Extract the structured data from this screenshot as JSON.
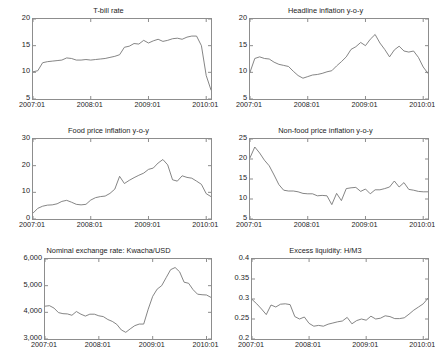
{
  "figure": {
    "width": 434,
    "height": 361,
    "background": "#ffffff",
    "line_color": "#6f6f6f",
    "axis_color": "#8d8d8d",
    "text_color": "#1c1c1c"
  },
  "chart_data": [
    {
      "id": "tbill",
      "type": "line",
      "title": "T-bill rate",
      "xlabel": "",
      "ylabel": "",
      "grid": false,
      "legend": null,
      "xlim": [
        2007.0,
        2010.083
      ],
      "ylim": [
        5,
        20
      ],
      "yticks": [
        5,
        10,
        15,
        20
      ],
      "ytick_labels": [
        "5",
        "10",
        "15",
        "20"
      ],
      "xticks": [
        2007.0,
        2008.0,
        2009.0,
        2010.0
      ],
      "xtick_labels": [
        "2007:01",
        "2008:01",
        "2009:01",
        "2010:01"
      ],
      "x": [
        2007.0,
        2007.083,
        2007.167,
        2007.25,
        2007.333,
        2007.417,
        2007.5,
        2007.583,
        2007.667,
        2007.75,
        2007.833,
        2007.917,
        2008.0,
        2008.083,
        2008.167,
        2008.25,
        2008.333,
        2008.417,
        2008.5,
        2008.583,
        2008.667,
        2008.75,
        2008.833,
        2008.917,
        2009.0,
        2009.083,
        2009.167,
        2009.25,
        2009.333,
        2009.417,
        2009.5,
        2009.583,
        2009.667,
        2009.75,
        2009.833,
        2009.917,
        2010.0,
        2010.083
      ],
      "values": [
        10.1,
        10.3,
        11.8,
        12.0,
        12.1,
        12.2,
        12.3,
        12.7,
        12.6,
        12.3,
        12.3,
        12.4,
        12.3,
        12.4,
        12.5,
        12.6,
        12.8,
        13.0,
        13.3,
        14.7,
        14.9,
        15.4,
        15.3,
        16.0,
        15.5,
        15.9,
        16.2,
        15.8,
        16.0,
        16.3,
        16.4,
        16.2,
        16.6,
        16.8,
        16.8,
        15.0,
        9.4,
        6.7
      ]
    },
    {
      "id": "headline",
      "type": "line",
      "title": "Headline inflation y-o-y",
      "xlabel": "",
      "ylabel": "",
      "grid": false,
      "legend": null,
      "xlim": [
        2007.0,
        2010.083
      ],
      "ylim": [
        5,
        20
      ],
      "yticks": [
        5,
        10,
        15,
        20
      ],
      "ytick_labels": [
        "5",
        "10",
        "15",
        "20"
      ],
      "xticks": [
        2007.0,
        2008.0,
        2009.0,
        2010.0
      ],
      "xtick_labels": [
        "2007:01",
        "2008:01",
        "2009:01",
        "2010:01"
      ],
      "x": [
        2007.0,
        2007.083,
        2007.167,
        2007.25,
        2007.333,
        2007.417,
        2007.5,
        2007.583,
        2007.667,
        2007.75,
        2007.833,
        2007.917,
        2008.0,
        2008.083,
        2008.167,
        2008.25,
        2008.333,
        2008.417,
        2008.5,
        2008.583,
        2008.667,
        2008.75,
        2008.833,
        2008.917,
        2009.0,
        2009.083,
        2009.167,
        2009.25,
        2009.333,
        2009.417,
        2009.5,
        2009.583,
        2009.667,
        2009.75,
        2009.833,
        2009.917,
        2010.0,
        2010.083
      ],
      "values": [
        10.0,
        12.6,
        12.9,
        12.6,
        12.5,
        11.9,
        11.5,
        11.3,
        11.1,
        10.2,
        9.4,
        8.9,
        9.2,
        9.5,
        9.6,
        9.8,
        10.1,
        10.3,
        11.2,
        12.0,
        12.9,
        14.3,
        14.8,
        15.6,
        15.0,
        16.2,
        17.1,
        15.5,
        14.3,
        12.9,
        14.2,
        14.9,
        14.0,
        13.8,
        14.0,
        12.8,
        11.0,
        9.8
      ]
    },
    {
      "id": "food",
      "type": "line",
      "title": "Food price inflation y-o-y",
      "xlabel": "",
      "ylabel": "",
      "grid": false,
      "legend": null,
      "xlim": [
        2007.0,
        2010.083
      ],
      "ylim": [
        0,
        30
      ],
      "yticks": [
        0,
        10,
        20,
        30
      ],
      "ytick_labels": [
        "0",
        "10",
        "20",
        "30"
      ],
      "xticks": [
        2007.0,
        2008.0,
        2009.0,
        2010.0
      ],
      "xtick_labels": [
        "2007:01",
        "2008:01",
        "2009:01",
        "2010:01"
      ],
      "x": [
        2007.0,
        2007.083,
        2007.167,
        2007.25,
        2007.333,
        2007.417,
        2007.5,
        2007.583,
        2007.667,
        2007.75,
        2007.833,
        2007.917,
        2008.0,
        2008.083,
        2008.167,
        2008.25,
        2008.333,
        2008.417,
        2008.5,
        2008.583,
        2008.667,
        2008.75,
        2008.833,
        2008.917,
        2009.0,
        2009.083,
        2009.167,
        2009.25,
        2009.333,
        2009.417,
        2009.5,
        2009.583,
        2009.667,
        2009.75,
        2009.833,
        2009.917,
        2010.0,
        2010.083
      ],
      "values": [
        2.2,
        4.0,
        4.8,
        5.2,
        5.3,
        5.7,
        6.6,
        7.0,
        6.3,
        5.5,
        5.3,
        5.5,
        7.1,
        8.0,
        8.4,
        8.6,
        9.6,
        11.2,
        16.0,
        13.3,
        14.5,
        15.5,
        16.4,
        17.2,
        18.6,
        19.1,
        21.0,
        22.3,
        20.3,
        14.7,
        14.2,
        16.2,
        15.6,
        15.3,
        14.2,
        13.0,
        9.5,
        8.4
      ]
    },
    {
      "id": "nonfood",
      "type": "line",
      "title": "Non-food price inflation y-o-y",
      "xlabel": "",
      "ylabel": "",
      "grid": false,
      "legend": null,
      "xlim": [
        2007.0,
        2010.083
      ],
      "ylim": [
        5,
        25
      ],
      "yticks": [
        5,
        10,
        15,
        20,
        25
      ],
      "ytick_labels": [
        "5",
        "10",
        "15",
        "20",
        "25"
      ],
      "xticks": [
        2007.0,
        2008.0,
        2009.0,
        2010.0
      ],
      "xtick_labels": [
        "2007:01",
        "2008:01",
        "2009:01",
        "2010:01"
      ],
      "x": [
        2007.0,
        2007.083,
        2007.167,
        2007.25,
        2007.333,
        2007.417,
        2007.5,
        2007.583,
        2007.667,
        2007.75,
        2007.833,
        2007.917,
        2008.0,
        2008.083,
        2008.167,
        2008.25,
        2008.333,
        2008.417,
        2008.5,
        2008.583,
        2008.667,
        2008.75,
        2008.833,
        2008.917,
        2009.0,
        2009.083,
        2009.167,
        2009.25,
        2009.333,
        2009.417,
        2009.5,
        2009.583,
        2009.667,
        2009.75,
        2009.833,
        2009.917,
        2010.0,
        2010.083
      ],
      "values": [
        20.3,
        23.0,
        21.5,
        19.7,
        18.3,
        16.0,
        13.6,
        12.2,
        12.0,
        12.0,
        11.8,
        11.4,
        11.3,
        11.3,
        10.8,
        10.9,
        10.8,
        8.6,
        11.4,
        9.6,
        12.6,
        12.8,
        12.9,
        11.9,
        12.5,
        11.3,
        12.3,
        12.3,
        12.6,
        13.0,
        14.5,
        13.0,
        14.1,
        12.4,
        12.2,
        11.9,
        11.8,
        11.8
      ]
    },
    {
      "id": "fx",
      "type": "line",
      "title": "Nominal exchange rate: Kwacha/USD",
      "xlabel": "",
      "ylabel": "",
      "grid": false,
      "legend": null,
      "xlim": [
        2007.0,
        2010.083
      ],
      "ylim": [
        3000,
        6000
      ],
      "yticks": [
        3000,
        4000,
        5000,
        6000
      ],
      "ytick_labels": [
        "3,000",
        "4,000",
        "5,000",
        "6,000"
      ],
      "xticks": [
        2007.0,
        2008.0,
        2009.0,
        2010.0
      ],
      "xtick_labels": [
        "2007:01",
        "2008:01",
        "2009:01",
        "2010:01"
      ],
      "x": [
        2007.0,
        2007.083,
        2007.167,
        2007.25,
        2007.333,
        2007.417,
        2007.5,
        2007.583,
        2007.667,
        2007.75,
        2007.833,
        2007.917,
        2008.0,
        2008.083,
        2008.167,
        2008.25,
        2008.333,
        2008.417,
        2008.5,
        2008.583,
        2008.667,
        2008.75,
        2008.833,
        2008.917,
        2009.0,
        2009.083,
        2009.167,
        2009.25,
        2009.333,
        2009.417,
        2009.5,
        2009.583,
        2009.667,
        2009.75,
        2009.833,
        2009.917,
        2010.0,
        2010.083
      ],
      "values": [
        4230,
        4250,
        4160,
        3990,
        3950,
        3940,
        3890,
        4030,
        3930,
        3860,
        3930,
        3930,
        3870,
        3840,
        3730,
        3660,
        3550,
        3340,
        3250,
        3380,
        3500,
        3560,
        3560,
        4120,
        4600,
        4870,
        5000,
        5300,
        5600,
        5680,
        5520,
        5130,
        5090,
        4850,
        4680,
        4660,
        4650,
        4560
      ]
    },
    {
      "id": "liquidity",
      "type": "line",
      "title": "Excess liquidity: H/M3",
      "xlabel": "",
      "ylabel": "",
      "grid": false,
      "legend": null,
      "xlim": [
        2007.0,
        2010.083
      ],
      "ylim": [
        0.2,
        0.4
      ],
      "yticks": [
        0.2,
        0.25,
        0.3,
        0.35,
        0.4
      ],
      "ytick_labels": [
        "0.2",
        "0.25",
        "0.3",
        "0.35",
        "0.4"
      ],
      "xticks": [
        2007.0,
        2008.0,
        2009.0,
        2010.0
      ],
      "xtick_labels": [
        "2007:01",
        "2008:01",
        "2009:01",
        "2010:01"
      ],
      "x": [
        2007.0,
        2007.083,
        2007.167,
        2007.25,
        2007.333,
        2007.417,
        2007.5,
        2007.583,
        2007.667,
        2007.75,
        2007.833,
        2007.917,
        2008.0,
        2008.083,
        2008.167,
        2008.25,
        2008.333,
        2008.417,
        2008.5,
        2008.583,
        2008.667,
        2008.75,
        2008.833,
        2008.917,
        2009.0,
        2009.083,
        2009.167,
        2009.25,
        2009.333,
        2009.417,
        2009.5,
        2009.583,
        2009.667,
        2009.75,
        2009.833,
        2009.917,
        2010.0,
        2010.083
      ],
      "values": [
        0.299,
        0.288,
        0.275,
        0.261,
        0.285,
        0.28,
        0.287,
        0.288,
        0.286,
        0.256,
        0.25,
        0.255,
        0.239,
        0.232,
        0.234,
        0.232,
        0.237,
        0.24,
        0.243,
        0.245,
        0.254,
        0.238,
        0.246,
        0.25,
        0.247,
        0.257,
        0.25,
        0.252,
        0.258,
        0.256,
        0.251,
        0.251,
        0.253,
        0.262,
        0.272,
        0.28,
        0.288,
        0.302
      ]
    }
  ]
}
